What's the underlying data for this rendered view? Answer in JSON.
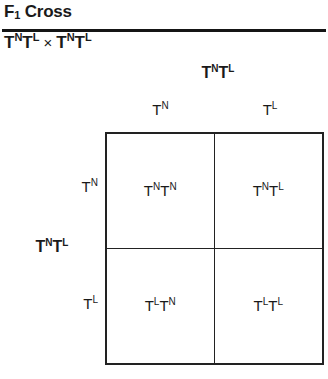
{
  "header": {
    "title_prefix": "F",
    "title_subscript": "1",
    "title_suffix": " Cross",
    "cross": {
      "parent1_base1": "T",
      "parent1_sup1": "N",
      "parent1_base2": "T",
      "parent1_sup2": "L",
      "operator": "×",
      "parent2_base1": "T",
      "parent2_sup1": "N",
      "parent2_base2": "T",
      "parent2_sup2": "L"
    }
  },
  "punnett": {
    "top_parent": {
      "base1": "T",
      "sup1": "N",
      "base2": "T",
      "sup2": "L"
    },
    "side_parent": {
      "base1": "T",
      "sup1": "N",
      "base2": "T",
      "sup2": "L"
    },
    "columns": [
      {
        "base": "T",
        "sup": "N"
      },
      {
        "base": "T",
        "sup": "L"
      }
    ],
    "rows": [
      {
        "base": "T",
        "sup": "N"
      },
      {
        "base": "T",
        "sup": "L"
      }
    ],
    "cells": [
      {
        "base1": "T",
        "sup1": "N",
        "base2": "T",
        "sup2": "N"
      },
      {
        "base1": "T",
        "sup1": "N",
        "base2": "T",
        "sup2": "L"
      },
      {
        "base1": "T",
        "sup1": "L",
        "base2": "T",
        "sup2": "N"
      },
      {
        "base1": "T",
        "sup1": "L",
        "base2": "T",
        "sup2": "L"
      }
    ]
  },
  "colors": {
    "text": "#1a1a1a",
    "rule": "#151515",
    "grid_line": "#222222",
    "background": "#ffffff"
  }
}
